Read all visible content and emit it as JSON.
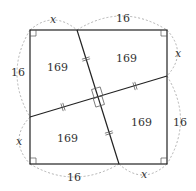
{
  "diagram": {
    "type": "geometry-square-dissection",
    "colors": {
      "stroke": "#222222",
      "dashed": "#9a9a9a",
      "text": "#333333",
      "background": "#ffffff"
    },
    "square": {
      "corners": [
        [
          30,
          30
        ],
        [
          167,
          30
        ],
        [
          167,
          164
        ],
        [
          30,
          164
        ]
      ]
    },
    "lines": [
      {
        "name": "steep-line",
        "from": [
          77,
          30
        ],
        "to": [
          119,
          164
        ]
      },
      {
        "name": "shallow-line",
        "from": [
          30,
          117
        ],
        "to": [
          167,
          76
        ]
      }
    ],
    "regions": [
      {
        "name": "region-top-left",
        "label": "169"
      },
      {
        "name": "region-top-right",
        "label": "169"
      },
      {
        "name": "region-bottom-left",
        "label": "169"
      },
      {
        "name": "region-bottom-right",
        "label": "169"
      }
    ],
    "side_labels": {
      "top_left": "x",
      "top_right": "16",
      "right_top": "x",
      "right_bottom": "16",
      "bottom_right": "x",
      "bottom_left": "16",
      "left_bottom": "x",
      "left_top": "16"
    }
  }
}
